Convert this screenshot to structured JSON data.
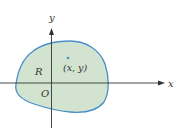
{
  "diagram": {
    "axes": {
      "x_label": "x",
      "y_label": "y",
      "origin_label": "O"
    },
    "region": {
      "label": "R",
      "fill_color": "#cfe3cf",
      "stroke_color": "#4a90c8"
    },
    "point": {
      "label": "(x, y)",
      "color": "#4a90c8"
    },
    "axis_color": "#333333"
  }
}
